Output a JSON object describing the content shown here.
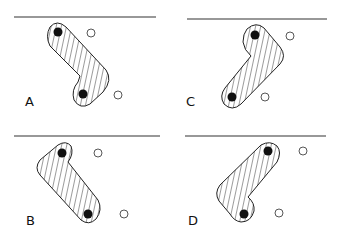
{
  "figure": {
    "panels": [
      {
        "id": "A",
        "label": "A"
      },
      {
        "id": "B",
        "label": "B"
      },
      {
        "id": "C",
        "label": "C"
      },
      {
        "id": "D",
        "label": "D"
      }
    ],
    "elements": {
      "surface_line": "horizontal line",
      "filled_dot": "filled circle",
      "open_dot": "open circle",
      "hatched_shape": "hatched bent shape"
    },
    "colors": {
      "ink": "#111111",
      "background": "#ffffff"
    }
  }
}
